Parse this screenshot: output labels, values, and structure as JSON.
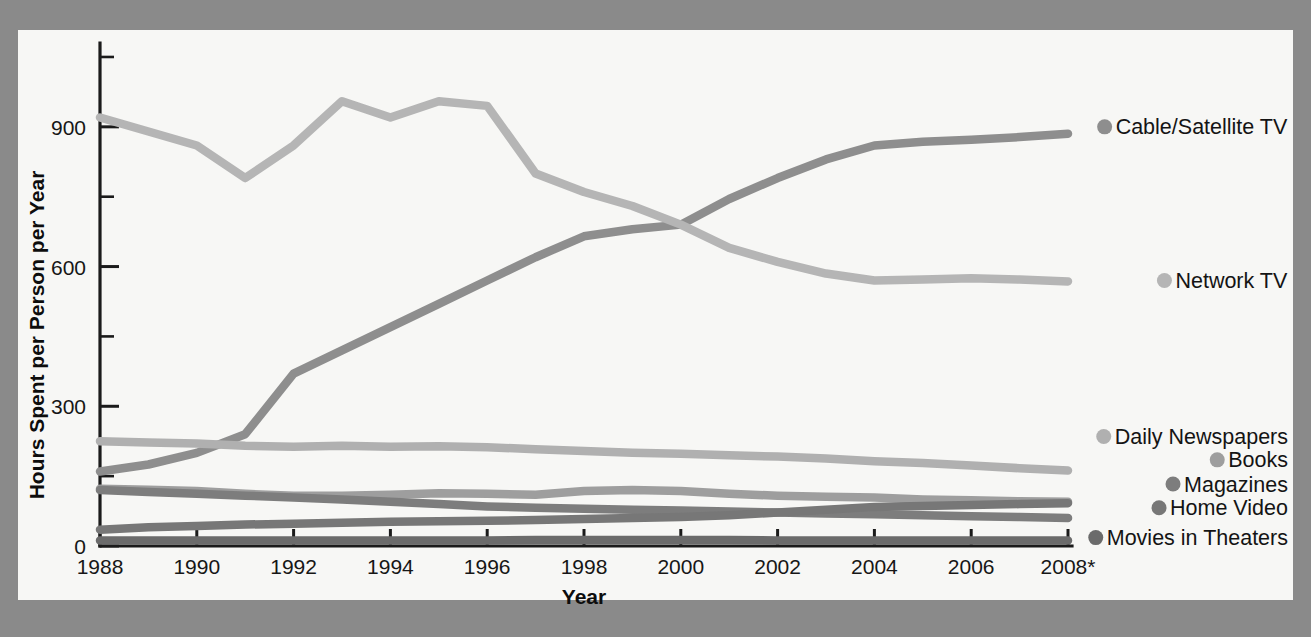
{
  "page": {
    "background_color": "#8a8a8a",
    "paper_color": "#f7f7f5"
  },
  "chart_data": {
    "type": "line",
    "title": "",
    "xlabel": "Year",
    "ylabel": "Hours Spent per Person per Year",
    "x": [
      1988,
      1989,
      1990,
      1991,
      1992,
      1993,
      1994,
      1995,
      1996,
      1997,
      1998,
      1999,
      2000,
      2001,
      2002,
      2003,
      2004,
      2005,
      2006,
      2007,
      2008
    ],
    "xtick_labels": [
      "1988",
      "1990",
      "1992",
      "1994",
      "1996",
      "1998",
      "2000",
      "2002",
      "2004",
      "2006",
      "2008*"
    ],
    "xticks": [
      1988,
      1990,
      1992,
      1994,
      1996,
      1998,
      2000,
      2002,
      2004,
      2006,
      2008
    ],
    "ytick_labels": [
      "0",
      "300",
      "600",
      "900"
    ],
    "yticks": [
      0,
      300,
      600,
      900
    ],
    "yticks_minor": [
      150,
      450,
      750,
      1050
    ],
    "xlim": [
      1988,
      2008
    ],
    "ylim": [
      0,
      1080
    ],
    "grid": false,
    "legend_position": "right",
    "series": [
      {
        "name": "Cable/Satellite TV",
        "color": "#8e8e8e",
        "legend_y": 900,
        "values": [
          160,
          175,
          200,
          240,
          370,
          420,
          470,
          520,
          570,
          620,
          665,
          680,
          690,
          745,
          790,
          830,
          860,
          868,
          872,
          878,
          885
        ]
      },
      {
        "name": "Network TV",
        "color": "#b5b5b5",
        "legend_y": 570,
        "values": [
          920,
          890,
          860,
          790,
          860,
          955,
          920,
          955,
          945,
          800,
          760,
          730,
          690,
          640,
          610,
          585,
          570,
          572,
          575,
          572,
          568
        ]
      },
      {
        "name": "Daily Newspapers",
        "color": "#b0b0b0",
        "legend_y": 235,
        "values": [
          225,
          222,
          220,
          215,
          213,
          215,
          213,
          214,
          212,
          208,
          204,
          200,
          198,
          195,
          192,
          188,
          182,
          178,
          173,
          167,
          162
        ]
      },
      {
        "name": "Books",
        "color": "#9e9e9e",
        "legend_y": 185,
        "values": [
          123,
          121,
          118,
          112,
          108,
          108,
          110,
          113,
          112,
          110,
          118,
          120,
          118,
          112,
          108,
          106,
          104,
          100,
          98,
          96,
          95
        ]
      },
      {
        "name": "Magazines",
        "color": "#7d7d7d",
        "legend_y": 133,
        "values": [
          120,
          116,
          112,
          108,
          104,
          100,
          95,
          90,
          85,
          82,
          80,
          78,
          76,
          74,
          72,
          70,
          68,
          66,
          64,
          62,
          60
        ]
      },
      {
        "name": "Home Video",
        "color": "#777777",
        "legend_y": 82,
        "values": [
          35,
          40,
          43,
          46,
          48,
          50,
          52,
          53,
          54,
          56,
          58,
          60,
          62,
          66,
          72,
          78,
          84,
          86,
          88,
          90,
          92
        ]
      },
      {
        "name": "Movies in Theaters",
        "color": "#6b6b6b",
        "legend_y": 18,
        "values": [
          12,
          12,
          12,
          12,
          12,
          12,
          12,
          12,
          12,
          13,
          13,
          13,
          13,
          13,
          12,
          12,
          12,
          12,
          12,
          12,
          12
        ]
      }
    ]
  }
}
